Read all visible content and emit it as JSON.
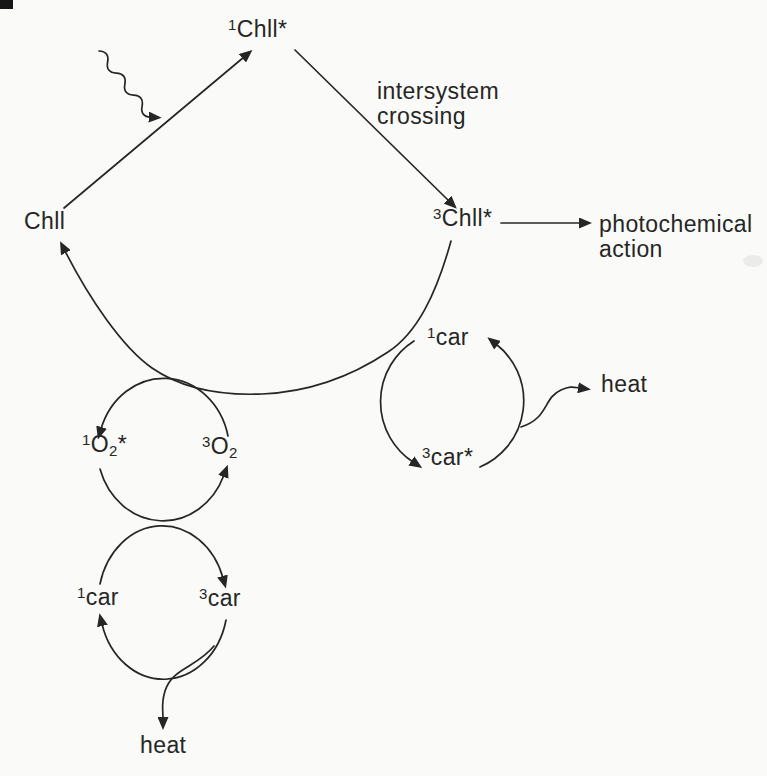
{
  "colors": {
    "paper": "#fafaf8",
    "ink": "#262626"
  },
  "labels": {
    "chl_ground": {
      "base": "Chll"
    },
    "chl_singlet": {
      "sup": "1",
      "base": "Chll",
      "star": "*"
    },
    "chl_triplet": {
      "sup": "3",
      "base": "Chll",
      "star": "*"
    },
    "intersystem_crossing": {
      "line1": "intersystem",
      "line2": "crossing"
    },
    "photochemical_action": {
      "line1": "photochemical",
      "line2": "action"
    },
    "car_singlet_right": {
      "sup": "1",
      "base": "car"
    },
    "car_triplet_right": {
      "sup": "3",
      "base": "car",
      "star": "*"
    },
    "heat_right": {
      "base": "heat"
    },
    "o2_singlet": {
      "sup": "1",
      "base": "O",
      "sub": "2",
      "star": "*"
    },
    "o2_triplet": {
      "sup": "3",
      "base": "O",
      "sub": "2"
    },
    "car_singlet_bottom": {
      "sup": "1",
      "base": "car"
    },
    "car_triplet_bottom": {
      "sup": "3",
      "base": "car"
    },
    "heat_bottom": {
      "base": "heat"
    }
  },
  "edges": [
    {
      "from": "Chll",
      "to": "1Chll*",
      "kind": "straight-arrow",
      "note": "excitation"
    },
    {
      "from": "photon",
      "to": "excitation-line",
      "kind": "wavy-arrow",
      "note": "light absorption"
    },
    {
      "from": "1Chll*",
      "to": "3Chll*",
      "kind": "straight-arrow",
      "note": "intersystem crossing"
    },
    {
      "from": "3Chll*",
      "to": "photochemical action",
      "kind": "straight-arrow"
    },
    {
      "from": "3Chll*",
      "to": "Chll",
      "kind": "large-return-arc",
      "note": "passes 1car and O2 cycle"
    },
    {
      "from": "3car*",
      "to": "1car",
      "kind": "cycle-arc",
      "cycle": "right-car"
    },
    {
      "from": "1car",
      "to": "3car*",
      "kind": "cycle-arc",
      "cycle": "right-car"
    },
    {
      "from": "right-car-cycle",
      "to": "heat",
      "kind": "curved-arrow"
    },
    {
      "from": "3O2",
      "to": "1O2*",
      "kind": "cycle-arc",
      "cycle": "oxygen"
    },
    {
      "from": "1O2*",
      "to": "3O2",
      "kind": "cycle-arc",
      "cycle": "oxygen"
    },
    {
      "from": "1car",
      "to": "3car",
      "kind": "cycle-arc",
      "cycle": "bottom-car"
    },
    {
      "from": "3car",
      "to": "1car",
      "kind": "cycle-arc",
      "cycle": "bottom-car"
    },
    {
      "from": "bottom-car-cycle",
      "to": "heat",
      "kind": "curved-arrow"
    }
  ]
}
